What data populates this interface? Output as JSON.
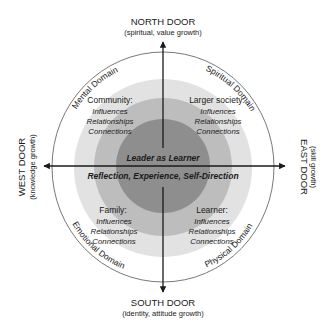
{
  "doors": {
    "north": {
      "title": "NORTH DOOR",
      "subtitle": "(spiritual, value growth)"
    },
    "south": {
      "title": "SOUTH DOOR",
      "subtitle": "(identity, attitude growth)"
    },
    "east": {
      "title": "EAST DOOR",
      "subtitle": "(skill growth)"
    },
    "west": {
      "title": "WEST DOOR",
      "subtitle": "(knowledge growth)"
    }
  },
  "domains": {
    "mental": "Mental Domain",
    "spiritual": "Spiritual Domain",
    "emotional": "Emotional Domain",
    "physical": "Physical Domain"
  },
  "quadrants": {
    "top_left": {
      "title": "Community:",
      "items": [
        "Influences",
        "Relationships",
        "Connections"
      ]
    },
    "top_right": {
      "title": "Larger society:",
      "items": [
        "Influences",
        "Relationships",
        "Connections"
      ]
    },
    "bottom_left": {
      "title": "Family:",
      "items": [
        "Influences",
        "Relationships",
        "Connections"
      ]
    },
    "bottom_right": {
      "title": "Learner:",
      "items": [
        "Influences",
        "Relationships",
        "Connections"
      ]
    }
  },
  "center": {
    "title": "Leader as Learner",
    "subtitle": "Reflection, Experience, Self-Direction"
  },
  "colors": {
    "outer_ring": "#e2e2e2",
    "middle_ring": "#bdbdbd",
    "inner_circle": "#8e8e8e",
    "lines": "#1a1a1a"
  }
}
